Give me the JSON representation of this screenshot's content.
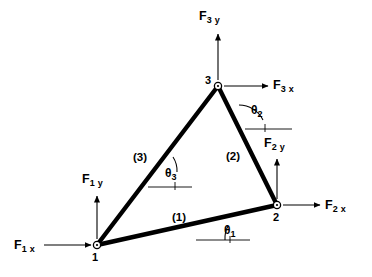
{
  "diagram": {
    "stroke_color": "#000000",
    "member_color": "#000000",
    "arrow_color": "#000000",
    "background": "#ffffff"
  },
  "nodes": [
    {
      "id": "1",
      "label": "1",
      "x": 97,
      "y": 245
    },
    {
      "id": "2",
      "label": "2",
      "x": 277,
      "y": 205
    },
    {
      "id": "3",
      "label": "3",
      "x": 218,
      "y": 86
    }
  ],
  "members": [
    {
      "id": "1",
      "label": "(1)",
      "from": "1",
      "to": "2"
    },
    {
      "id": "2",
      "label": "(2)",
      "from": "2",
      "to": "3"
    },
    {
      "id": "3",
      "label": "(3)",
      "from": "3",
      "to": "1"
    }
  ],
  "forces": [
    {
      "id": "F1x",
      "base": "F",
      "sub": "1 x",
      "node": "1",
      "direction": "right"
    },
    {
      "id": "F1y",
      "base": "F",
      "sub": "1 y",
      "node": "1",
      "direction": "up"
    },
    {
      "id": "F2x",
      "base": "F",
      "sub": "2 x",
      "node": "2",
      "direction": "right"
    },
    {
      "id": "F2y",
      "base": "F",
      "sub": "2 y",
      "node": "2",
      "direction": "up"
    },
    {
      "id": "F3x",
      "base": "F",
      "sub": "3 x",
      "node": "3",
      "direction": "right"
    },
    {
      "id": "F3y",
      "base": "F",
      "sub": "3 y",
      "node": "3",
      "direction": "up"
    }
  ],
  "angles": [
    {
      "id": "theta1",
      "base": "θ",
      "sub": "1",
      "member": "1"
    },
    {
      "id": "theta2",
      "base": "θ",
      "sub": "2",
      "member": "2"
    },
    {
      "id": "theta3",
      "base": "θ",
      "sub": "3",
      "member": "3"
    }
  ]
}
